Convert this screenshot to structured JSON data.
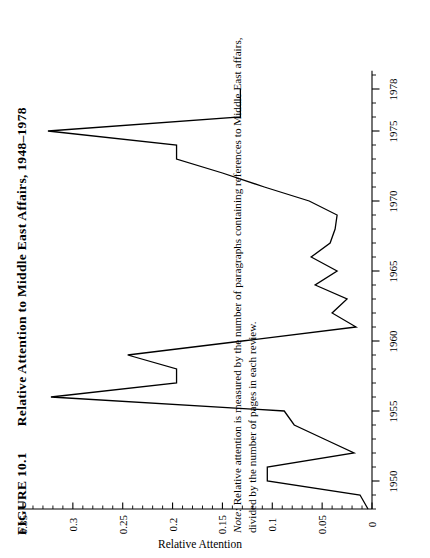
{
  "figure": {
    "label": "FIGURE 10.1",
    "caption": "Relative Attention to Middle East Affairs, 1948–1978",
    "note_lead": "Note:",
    "note_text": " Relative attention is measured by the number of paragraphs containing references to Middle East affairs, divided by the number of pages in each review.",
    "note_full": "Note: Relative attention is measured by the number of paragraphs containing references to Middle East affairs, divided by the number of pages in each review."
  },
  "colors": {
    "line": "#000000",
    "axis": "#000000",
    "background": "#ffffff"
  },
  "chart_data": {
    "type": "line",
    "title": "Relative Attention to Middle East Affairs, 1948–1978",
    "xlabel": "",
    "ylabel": "Relative Attention",
    "orientation": "rotated-90-ccw",
    "xlim": [
      1948,
      1979
    ],
    "ylim": [
      0,
      0.35
    ],
    "grid": false,
    "legend": false,
    "x_tick_labels": [
      "1950",
      "1955",
      "1960",
      "1965",
      "1970",
      "1975",
      "1978"
    ],
    "x_tick_values": [
      1950,
      1955,
      1960,
      1965,
      1970,
      1975,
      1978
    ],
    "x_minor_tick_step": 1,
    "y_tick_labels": [
      "0",
      "0.05",
      "0.1",
      "0.15",
      "0.2",
      "0.25",
      "0.3",
      "0.35"
    ],
    "y_tick_values": [
      0,
      0.05,
      0.1,
      0.15,
      0.2,
      0.25,
      0.3,
      0.35
    ],
    "y_minor_tick_step": 0.01,
    "series_name": "Relative Attention",
    "x": [
      1948,
      1949,
      1950,
      1951,
      1952,
      1953,
      1954,
      1955,
      1956,
      1957,
      1958,
      1959,
      1960,
      1961,
      1962,
      1963,
      1964,
      1965,
      1966,
      1967,
      1968,
      1969,
      1970,
      1971,
      1972,
      1973,
      1974,
      1975,
      1976,
      1977,
      1978
    ],
    "values": [
      0.004,
      0.012,
      0.105,
      0.105,
      0.018,
      0.048,
      0.078,
      0.088,
      0.322,
      0.196,
      0.196,
      0.245,
      0.13,
      0.016,
      0.04,
      0.025,
      0.057,
      0.035,
      0.061,
      0.042,
      0.037,
      0.035,
      0.063,
      0.108,
      0.15,
      0.196,
      0.196,
      0.325,
      0.132,
      0.132,
      0.132
    ]
  }
}
